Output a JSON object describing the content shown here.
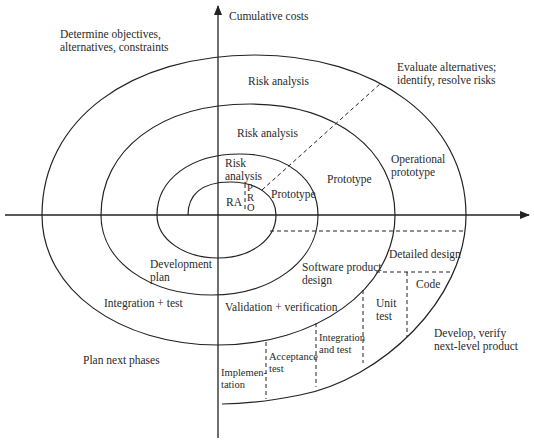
{
  "diagram": {
    "axes": {
      "vertical_label": "Cumulative costs"
    },
    "quadrants": {
      "top_left": [
        "Determine objectives,",
        "alternatives, constraints"
      ],
      "top_right": [
        "Evaluate alternatives;",
        "identify, resolve risks"
      ],
      "bottom_right": [
        "Develop, verify",
        "next-level product"
      ],
      "bottom_left": "Plan next phases"
    },
    "risk_labels": {
      "outer": "Risk analysis",
      "middle": "Risk analysis",
      "inner_line1": "Risk",
      "inner_line2": "analysis",
      "innermost": "RA"
    },
    "prototype_labels": {
      "pro": [
        "P",
        "R",
        "O"
      ],
      "inner": "Prototype",
      "middle": "Prototype",
      "outer_line1": "Operational",
      "outer_line2": "prototype"
    },
    "planning_labels": {
      "development_plan_line1": "Development",
      "development_plan_line2": "plan",
      "integration_test": "Integration + test"
    },
    "development_labels": {
      "software_product_design_line1": "Software product",
      "software_product_design_line2": "design",
      "validation_verification": "Validation + verification",
      "detailed_design": "Detailed design",
      "code": "Code",
      "unit_test_line1": "Unit",
      "unit_test_line2": "test",
      "integration_and_test_line1": "Integration",
      "integration_and_test_line2": "and test",
      "acceptance_test_line1": "Acceptance",
      "acceptance_test_line2": "test",
      "implementation_line1": "Implemen-",
      "implementation_line2": "tation"
    },
    "colors": {
      "line": "#222222",
      "background": "#ffffff"
    }
  }
}
